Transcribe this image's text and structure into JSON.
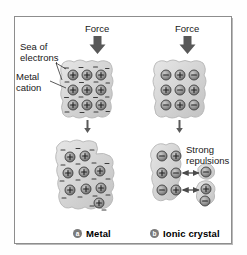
{
  "figure": {
    "colors": {
      "frame": "#8d8d8d",
      "blob_fill": "#d9d9d9",
      "blob_edge": "#b0b0b0",
      "ion_fill": "#9e9e9e",
      "ion_edge": "#4a4a4a",
      "arrow": "#5a5a5a",
      "text": "#181818",
      "background": "#ffffff"
    }
  },
  "labels": {
    "force_left": "Force",
    "force_right": "Force",
    "sea_of_electrons": "Sea of\nelectrons",
    "metal_cation": "Metal\ncation",
    "strong_repulsions": "Strong\nrepulsions"
  },
  "captions": [
    {
      "marker": "a",
      "label": "Metal"
    },
    {
      "marker": "b",
      "label": "Ionic crystal"
    }
  ],
  "panels": {
    "metal": {
      "caption": "Metal",
      "marker": "a",
      "before": {
        "description": "Undeformed metal lattice: 3 by 3 grid of metal cations embedded in a delocalized sea of electrons",
        "rows": [
          [
            "+",
            "+",
            "+"
          ],
          [
            "+",
            "+",
            "+"
          ],
          [
            "+",
            "+",
            "+"
          ]
        ]
      },
      "after": {
        "description": "Metal deforms: cation layers slide past one another, electron sea keeps the lattice bonded, no fracture",
        "rows": [
          [
            "+",
            "+",
            ""
          ],
          [
            "+",
            "+",
            "+"
          ],
          [
            "+",
            "+",
            "+"
          ],
          [
            "",
            "",
            "+"
          ]
        ]
      },
      "charge_symbols": {
        "cation": "+",
        "electron": "−"
      }
    },
    "ionic": {
      "caption": "Ionic crystal",
      "marker": "b",
      "before": {
        "description": "Undeformed ionic crystal: alternating checkerboard of cations and anions",
        "rows": [
          [
            "−",
            "+",
            "−"
          ],
          [
            "+",
            "−",
            "+"
          ],
          [
            "−",
            "+",
            "−"
          ]
        ]
      },
      "after": {
        "description": "Layers shift so like charges align; strong repulsions split the crystal and fragments break away",
        "rows": [
          [
            "−",
            "+"
          ],
          [
            "+",
            "−"
          ],
          [
            "−",
            "+"
          ]
        ],
        "fragments": [
          "−",
          "+",
          "−"
        ],
        "repulsion_arrows": 2
      },
      "charge_symbols": {
        "cation": "+",
        "anion": "−"
      }
    }
  },
  "arrows": {
    "force_arrow_count": 2,
    "transition_arrow_count": 2,
    "repulsion_arrow_count": 2
  }
}
